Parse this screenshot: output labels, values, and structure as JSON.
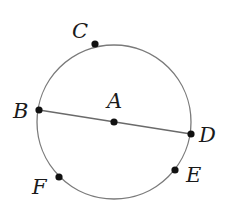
{
  "diagram": {
    "type": "circle-geometry",
    "circle": {
      "cx": 114,
      "cy": 122,
      "r": 77,
      "stroke": "#7a7a7a"
    },
    "segment": {
      "from": "B",
      "to": "D",
      "stroke": "#6a6a6a"
    },
    "center_label": "A",
    "points": [
      {
        "label": "C",
        "x": 95,
        "y": 44,
        "lx": 72,
        "ly": 38
      },
      {
        "label": "B",
        "x": 39,
        "y": 110,
        "lx": 13,
        "ly": 118
      },
      {
        "label": "A",
        "x": 114,
        "y": 122,
        "lx": 107,
        "ly": 108
      },
      {
        "label": "D",
        "x": 191,
        "y": 134,
        "lx": 199,
        "ly": 142
      },
      {
        "label": "E",
        "x": 175,
        "y": 170,
        "lx": 186,
        "ly": 182
      },
      {
        "label": "F",
        "x": 59,
        "y": 177,
        "lx": 32,
        "ly": 194
      }
    ]
  }
}
